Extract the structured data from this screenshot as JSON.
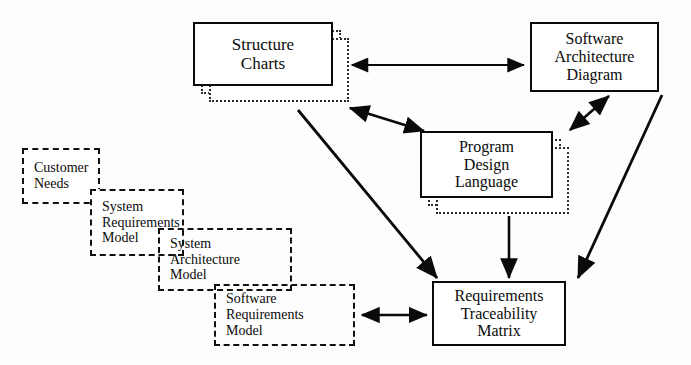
{
  "diagram": {
    "background_color": "#fdfdfd",
    "line_color": "#0a0a0a",
    "nodes": {
      "structure_charts": {
        "lines": [
          "Structure",
          "Charts"
        ],
        "style": "solid",
        "x": 193,
        "y": 22,
        "w": 140,
        "h": 64,
        "font_size": 17,
        "stacked_copies": 2
      },
      "software_architecture_diagram": {
        "lines": [
          "Software",
          "Architecture",
          "Diagram"
        ],
        "style": "solid",
        "x": 530,
        "y": 22,
        "w": 129,
        "h": 70,
        "font_size": 16,
        "stacked_copies": 0
      },
      "program_design_language": {
        "lines": [
          "Program",
          "Design",
          "Language"
        ],
        "style": "solid",
        "x": 420,
        "y": 131,
        "w": 133,
        "h": 67,
        "font_size": 16,
        "stacked_copies": 2
      },
      "requirements_traceability_matrix": {
        "lines": [
          "Requirements",
          "Traceability",
          "Matrix"
        ],
        "style": "solid",
        "x": 432,
        "y": 281,
        "w": 134,
        "h": 65,
        "font_size": 16,
        "stacked_copies": 0
      },
      "customer_needs": {
        "lines": [
          "Customer",
          "Needs"
        ],
        "style": "dashed",
        "x": 22,
        "y": 148,
        "w": 78,
        "h": 56,
        "font_size": 14
      },
      "system_requirements_model": {
        "lines": [
          "System",
          "Requirements",
          "Model"
        ],
        "style": "dashed",
        "x": 90,
        "y": 189,
        "w": 94,
        "h": 67,
        "font_size": 14
      },
      "system_architecture_model": {
        "lines": [
          "System",
          "Architecture",
          "Model"
        ],
        "style": "dashed",
        "x": 158,
        "y": 228,
        "w": 134,
        "h": 63,
        "font_size": 14
      },
      "software_requirements_model": {
        "lines": [
          "Software",
          "Requirements",
          "Model"
        ],
        "style": "dashed",
        "x": 214,
        "y": 284,
        "w": 141,
        "h": 62,
        "font_size": 14
      }
    },
    "connections": [
      {
        "name": "structure-charts-to-software-architecture-diagram",
        "from": "structure_charts",
        "to": "software_architecture_diagram",
        "arrowheads": "both",
        "shape": "horizontal"
      },
      {
        "name": "structure-charts-to-program-design-language",
        "from": "structure_charts",
        "to": "program_design_language",
        "arrowheads": "both",
        "shape": "diagonal"
      },
      {
        "name": "software-architecture-diagram-to-program-design-language",
        "from": "software_architecture_diagram",
        "to": "program_design_language",
        "arrowheads": "both",
        "shape": "diagonal"
      },
      {
        "name": "structure-charts-to-requirements-traceability-matrix",
        "from": "structure_charts",
        "to": "requirements_traceability_matrix",
        "arrowheads": "end",
        "shape": "diagonal"
      },
      {
        "name": "program-design-language-to-requirements-traceability-matrix",
        "from": "program_design_language",
        "to": "requirements_traceability_matrix",
        "arrowheads": "end",
        "shape": "vertical"
      },
      {
        "name": "software-architecture-diagram-to-requirements-traceability-matrix",
        "from": "software_architecture_diagram",
        "to": "requirements_traceability_matrix",
        "arrowheads": "end",
        "shape": "diagonal"
      },
      {
        "name": "software-requirements-model-to-requirements-traceability-matrix",
        "from": "software_requirements_model",
        "to": "requirements_traceability_matrix",
        "arrowheads": "both",
        "shape": "horizontal"
      }
    ]
  }
}
